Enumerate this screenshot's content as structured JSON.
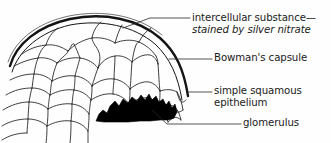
{
  "figure": {
    "kind": "anatomical-line-drawing",
    "background_color": "#fefefe",
    "ink_color": "#1a1a1a",
    "fill_color": "#000000"
  },
  "labels": {
    "intercellular": {
      "line1": "intercellular substance—",
      "line2": "stained by silver nitrate"
    },
    "bowmans": {
      "line1": "Bowman's capsule"
    },
    "epithelium": {
      "line1": "simple squamous",
      "line2": "epithelium"
    },
    "glomerulus": {
      "line1": "glomerulus"
    }
  },
  "structures": {
    "capsule_arc": "capsule-outline",
    "cell_mosaic": "squamous-cell-mosaic",
    "glomerulus_mass": "glomerulus-blob"
  }
}
